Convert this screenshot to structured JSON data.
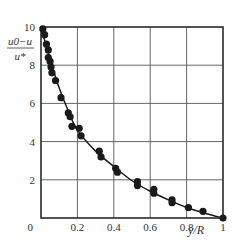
{
  "chart_data": {
    "type": "scatter",
    "title": "",
    "xlabel": "y/R",
    "ylabel": "(u0−u)/u*",
    "ylabel_numerator": "u0−u",
    "ylabel_denominator": "u*",
    "xlim": [
      0,
      1
    ],
    "ylim": [
      0,
      10
    ],
    "grid": true,
    "legend": null,
    "x_ticks": [
      0,
      0.2,
      0.4,
      0.6,
      0.8,
      1
    ],
    "x_tick_labels": [
      "0",
      "0.2",
      "0.4",
      "0.6",
      "0.8",
      "1"
    ],
    "y_ticks": [
      0,
      2,
      4,
      6,
      8,
      10
    ],
    "y_tick_labels": [
      "0",
      "2",
      "4",
      "6",
      "8",
      "10"
    ],
    "series": [
      {
        "name": "measured",
        "kind": "scatter",
        "color": "#1a1a1a",
        "points": [
          [
            0.01,
            9.9
          ],
          [
            0.02,
            9.6
          ],
          [
            0.03,
            9.1
          ],
          [
            0.04,
            8.8
          ],
          [
            0.04,
            8.4
          ],
          [
            0.05,
            8.2
          ],
          [
            0.055,
            7.9
          ],
          [
            0.06,
            7.6
          ],
          [
            0.08,
            7.2
          ],
          [
            0.11,
            6.3
          ],
          [
            0.15,
            5.5
          ],
          [
            0.16,
            5.3
          ],
          [
            0.17,
            4.8
          ],
          [
            0.21,
            4.7
          ],
          [
            0.22,
            4.3
          ],
          [
            0.32,
            3.5
          ],
          [
            0.33,
            3.2
          ],
          [
            0.41,
            2.6
          ],
          [
            0.42,
            2.4
          ],
          [
            0.53,
            1.9
          ],
          [
            0.53,
            1.7
          ],
          [
            0.62,
            1.5
          ],
          [
            0.62,
            1.3
          ],
          [
            0.72,
            0.95
          ],
          [
            0.72,
            0.8
          ],
          [
            0.81,
            0.55
          ],
          [
            0.89,
            0.35
          ],
          [
            1.0,
            0.0
          ]
        ]
      },
      {
        "name": "fit curve",
        "kind": "line",
        "color": "#1a1a1a",
        "points": [
          [
            0.0,
            10.0
          ],
          [
            0.02,
            9.3
          ],
          [
            0.05,
            8.3
          ],
          [
            0.1,
            6.8
          ],
          [
            0.15,
            5.6
          ],
          [
            0.2,
            4.6
          ],
          [
            0.3,
            3.5
          ],
          [
            0.4,
            2.7
          ],
          [
            0.5,
            1.95
          ],
          [
            0.6,
            1.4
          ],
          [
            0.7,
            0.95
          ],
          [
            0.8,
            0.55
          ],
          [
            0.9,
            0.25
          ],
          [
            1.0,
            0.0
          ]
        ]
      }
    ]
  },
  "layout": {
    "plot_left": 41,
    "plot_right": 223,
    "plot_top": 27,
    "plot_bottom": 218
  }
}
